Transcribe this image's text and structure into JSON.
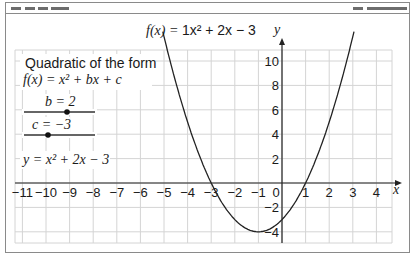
{
  "header": {
    "left_placeholders": [
      "menu-1",
      "menu-2",
      "menu-3",
      "menu-4"
    ],
    "right_placeholders": [
      "control-1",
      "control-2"
    ]
  },
  "graph": {
    "function_label_prefix": "f(x) = ",
    "function_label_body": "1x² + 2x − 3",
    "y_axis_label": "y",
    "x_axis_label": "x"
  },
  "panel": {
    "title": "Quadratic of the form",
    "general_form": "f(x) = x² + bx + c",
    "slider_b_label": "b = 2",
    "slider_c_label": "c = −3",
    "equation": "y = x² + 2x − 3"
  },
  "sliders": {
    "b": {
      "value": 2,
      "min": -2,
      "max": 4
    },
    "c": {
      "value": -3,
      "min": -4,
      "max": 2
    }
  },
  "colors": {
    "curve": "#222222",
    "grid": "#d4d4d4",
    "axis": "#222222"
  },
  "chart_data": {
    "type": "line",
    "title": "f(x) = 1x² + 2x − 3",
    "xlabel": "x",
    "ylabel": "y",
    "xlim": [
      -11.3,
      4.6
    ],
    "ylim": [
      -5,
      11
    ],
    "x_ticks": [
      -11,
      -10,
      -9,
      -8,
      -7,
      -6,
      -5,
      -4,
      -3,
      -2,
      -1,
      0,
      1,
      2,
      3,
      4
    ],
    "y_ticks": [
      -4,
      -2,
      2,
      4,
      6,
      8,
      10
    ],
    "grid": true,
    "series": [
      {
        "name": "y = x² + 2x − 3",
        "x": [
          -5,
          -4,
          -3,
          -2,
          -1,
          0,
          1,
          2,
          3
        ],
        "values": [
          12,
          5,
          0,
          -3,
          -4,
          -3,
          0,
          5,
          12
        ]
      }
    ],
    "annotations": [
      "Quadratic of the form",
      "f(x) = x² + bx + c",
      "b = 2",
      "c = −3",
      "y = x² + 2x − 3"
    ]
  }
}
